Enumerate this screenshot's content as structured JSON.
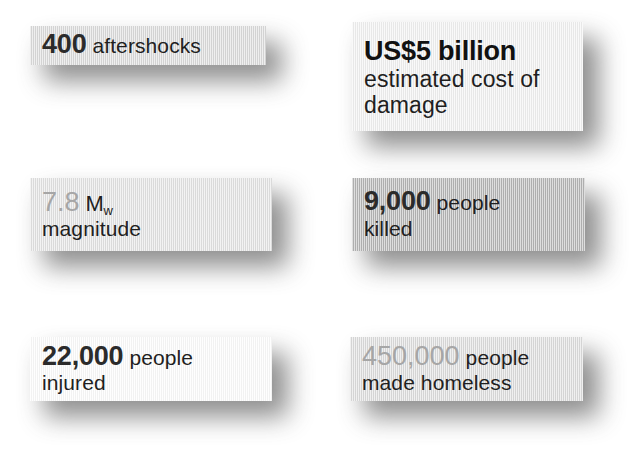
{
  "infographic": {
    "type": "fact-card-grid",
    "columns": 2,
    "rows": 3,
    "background_color": "#ffffff",
    "cards": [
      {
        "id": "aftershocks",
        "value": "400",
        "label": "aftershocks",
        "value_style": "dark",
        "card_color": "#dcdcdc",
        "lines": 1
      },
      {
        "id": "cost",
        "value": "US$5 billion",
        "label_line_1": "estimated cost of",
        "label_line_2": "damage",
        "value_style": "ink",
        "card_color": "#f2f2f2",
        "lines": 3
      },
      {
        "id": "magnitude",
        "value": "7.8",
        "unit": "M",
        "unit_subscript": "w",
        "label": "magnitude",
        "value_style": "light",
        "card_color": "#e4e4e4",
        "lines": 2
      },
      {
        "id": "killed",
        "value": "9,000",
        "label_line_1": "people",
        "label_line_2": "killed",
        "value_style": "dark",
        "card_color": "#b6b6b6",
        "lines": 2
      },
      {
        "id": "injured",
        "value": "22,000",
        "label_line_1": "people",
        "label_line_2": "injured",
        "value_style": "dark",
        "card_color": "#fdfdfd",
        "lines": 2
      },
      {
        "id": "homeless",
        "value": "450,000",
        "label_line_1": "people",
        "label_line_2": "made homeless",
        "value_style": "light",
        "card_color": "#dedede",
        "lines": 2
      }
    ]
  }
}
